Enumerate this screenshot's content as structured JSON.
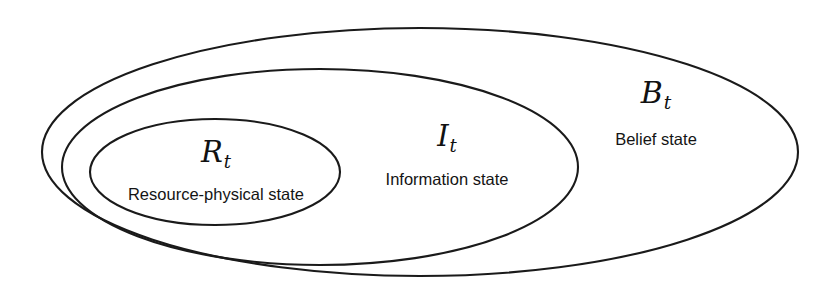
{
  "figure": {
    "type": "nested-venn-diagram",
    "background_color": "#ffffff",
    "stroke_color": "#1a1a1a"
  },
  "regions": [
    {
      "id": "belief",
      "symbol_letter": "B",
      "symbol_subscript": "t",
      "caption": "Belief state",
      "nesting_level": 0,
      "ellipse": {
        "cx": 420,
        "cy": 152,
        "rx": 378,
        "ry": 124
      }
    },
    {
      "id": "information",
      "symbol_letter": "I",
      "symbol_subscript": "t",
      "caption": "Information state",
      "nesting_level": 1,
      "ellipse": {
        "cx": 320,
        "cy": 167,
        "rx": 258,
        "ry": 98
      }
    },
    {
      "id": "resource",
      "symbol_letter": "R",
      "symbol_subscript": "t",
      "caption": "Resource-physical state",
      "nesting_level": 2,
      "ellipse": {
        "cx": 215,
        "cy": 172,
        "rx": 125,
        "ry": 53
      }
    }
  ]
}
